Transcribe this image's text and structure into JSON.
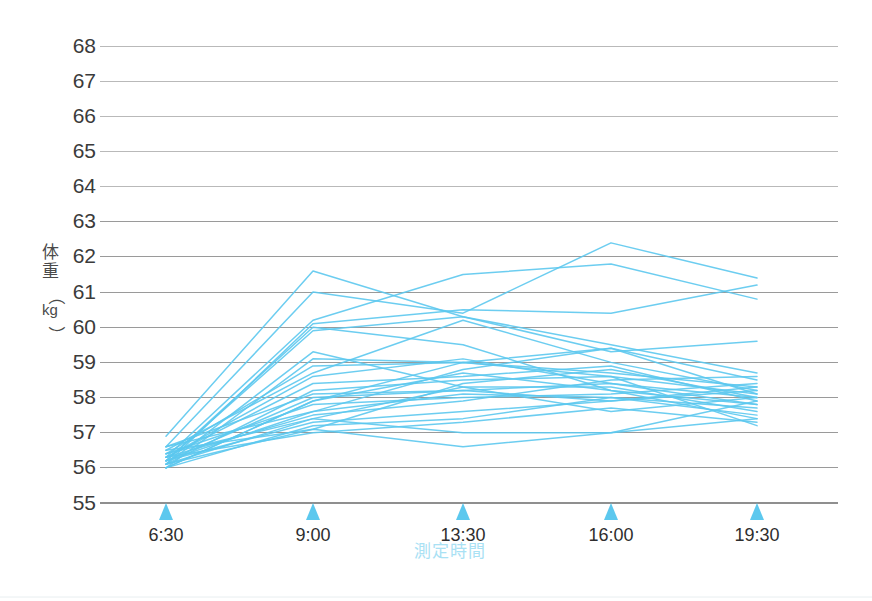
{
  "chart_data": {
    "type": "line",
    "title": "",
    "subtitle": "",
    "xlabel": "測定時間",
    "ylabel": "体重（kg）",
    "ylabel_chars": [
      "体",
      "重",
      "（",
      "kg",
      "）"
    ],
    "categories": [
      "6:30",
      "9:00",
      "13:30",
      "16:00",
      "19:30"
    ],
    "x_tick_labels": [
      "6:30",
      "9:00",
      "13:30",
      "16:00",
      "19:30"
    ],
    "y_tick_labels": [
      "68",
      "67",
      "66",
      "65",
      "64",
      "63",
      "62",
      "61",
      "60",
      "59",
      "58",
      "57",
      "56",
      "55"
    ],
    "y_ticks": [
      68,
      67,
      66,
      65,
      64,
      63,
      62,
      61,
      60,
      59,
      58,
      57,
      56,
      55
    ],
    "ylim": [
      55,
      68
    ],
    "y_step": 1,
    "grid": true,
    "grid_axis": "y",
    "legend": false,
    "legend_position": "none",
    "units": "kg",
    "line_color": "#5cc8ee",
    "grid_color": "#9a9a9a",
    "axis_title_color": "#a9e1f4",
    "tick_marker_color": "#5cc8ee",
    "series_count": 28,
    "series": [
      {
        "name": "subject-01",
        "values": [
          56.9,
          61.6,
          60.3,
          59.5,
          58.7
        ]
      },
      {
        "name": "subject-02",
        "values": [
          56.6,
          61.0,
          60.4,
          62.4,
          61.4
        ]
      },
      {
        "name": "subject-03",
        "values": [
          56.3,
          60.2,
          61.5,
          61.8,
          60.8
        ]
      },
      {
        "name": "subject-04",
        "values": [
          56.1,
          60.1,
          60.5,
          60.4,
          61.2
        ]
      },
      {
        "name": "subject-05",
        "values": [
          56.2,
          59.9,
          60.3,
          59.3,
          59.6
        ]
      },
      {
        "name": "subject-06",
        "values": [
          56.0,
          59.1,
          59.0,
          59.4,
          58.5
        ]
      },
      {
        "name": "subject-07",
        "values": [
          56.4,
          58.9,
          59.0,
          58.7,
          58.3
        ]
      },
      {
        "name": "subject-08",
        "values": [
          56.5,
          58.7,
          60.2,
          59.0,
          58.2
        ]
      },
      {
        "name": "subject-09",
        "values": [
          56.3,
          58.4,
          58.6,
          58.9,
          57.9
        ]
      },
      {
        "name": "subject-10",
        "values": [
          56.1,
          58.2,
          58.5,
          58.6,
          58.1
        ]
      },
      {
        "name": "subject-11",
        "values": [
          56.2,
          58.0,
          58.2,
          58.4,
          58.0
        ]
      },
      {
        "name": "subject-12",
        "values": [
          56.0,
          57.9,
          58.7,
          58.2,
          57.8
        ]
      },
      {
        "name": "subject-13",
        "values": [
          56.4,
          57.8,
          58.0,
          58.1,
          58.4
        ]
      },
      {
        "name": "subject-14",
        "values": [
          56.6,
          57.6,
          58.1,
          58.0,
          57.7
        ]
      },
      {
        "name": "subject-15",
        "values": [
          56.3,
          57.5,
          57.9,
          58.5,
          58.6
        ]
      },
      {
        "name": "subject-16",
        "values": [
          56.1,
          57.4,
          58.3,
          58.3,
          57.6
        ]
      },
      {
        "name": "subject-17",
        "values": [
          56.2,
          57.3,
          57.6,
          57.9,
          58.2
        ]
      },
      {
        "name": "subject-18",
        "values": [
          56.0,
          57.2,
          57.4,
          58.0,
          57.5
        ]
      },
      {
        "name": "subject-19",
        "values": [
          56.5,
          57.1,
          58.4,
          58.8,
          58.0
        ]
      },
      {
        "name": "subject-20",
        "values": [
          56.3,
          57.0,
          57.3,
          57.7,
          57.3
        ]
      },
      {
        "name": "subject-21",
        "values": [
          56.1,
          57.1,
          56.6,
          57.0,
          57.4
        ]
      },
      {
        "name": "subject-22",
        "values": [
          56.4,
          57.4,
          57.0,
          57.0,
          57.9
        ]
      },
      {
        "name": "subject-23",
        "values": [
          56.2,
          57.6,
          58.8,
          59.4,
          58.1
        ]
      },
      {
        "name": "subject-24",
        "values": [
          56.0,
          57.9,
          59.0,
          58.6,
          57.2
        ]
      },
      {
        "name": "subject-25",
        "values": [
          56.6,
          58.1,
          58.2,
          57.9,
          58.3
        ]
      },
      {
        "name": "subject-26",
        "values": [
          56.3,
          58.6,
          59.1,
          58.4,
          57.8
        ]
      },
      {
        "name": "subject-27",
        "values": [
          56.1,
          59.3,
          58.3,
          57.6,
          58.0
        ]
      },
      {
        "name": "subject-28",
        "values": [
          56.2,
          60.0,
          59.5,
          58.2,
          57.4
        ]
      }
    ]
  },
  "axes": {
    "y_axis_name": "weight-axis",
    "x_axis_name": "time-axis"
  }
}
